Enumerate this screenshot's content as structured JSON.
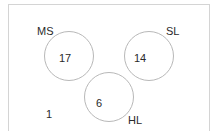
{
  "diagram": {
    "type": "venn",
    "sets": [
      {
        "label": "MS",
        "count": "17"
      },
      {
        "label": "SL",
        "count": "14"
      },
      {
        "label": "HL",
        "count": "6"
      }
    ],
    "outside_count": "1"
  }
}
